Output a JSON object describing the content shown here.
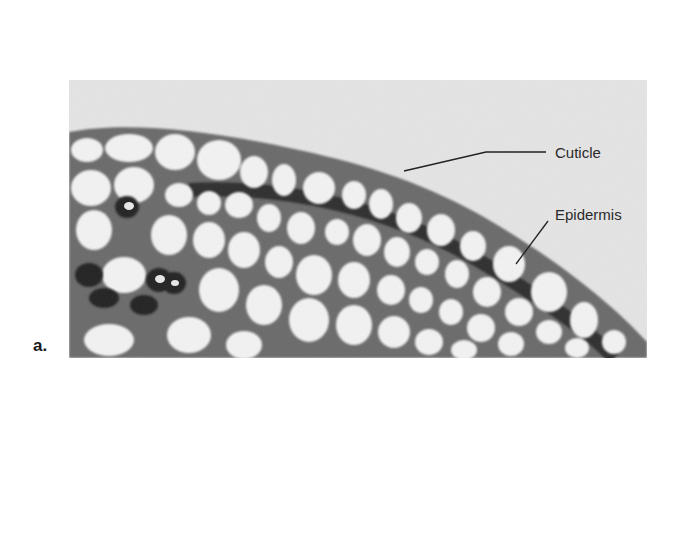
{
  "figure": {
    "panel_label": "a.",
    "labels": [
      {
        "id": "cuticle",
        "text": "Cuticle"
      },
      {
        "id": "epidermis",
        "text": "Epidermis"
      }
    ],
    "colors": {
      "background": "#e6e6e6",
      "cell_wall": "#5a5a5a",
      "cell_lumen": "#f2f2f2",
      "dark_band": "#2e2e2e",
      "leader_line": "#222222"
    }
  }
}
